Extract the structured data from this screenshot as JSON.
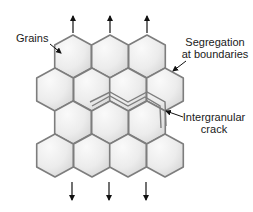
{
  "diagram": {
    "labels": {
      "grains": "Grains",
      "segregation_line1": "Segregation",
      "segregation_line2": "at boundaries",
      "crack_line1": "Intergranular",
      "crack_line2": "crack"
    },
    "colors": {
      "grain_fill_light": "#f7f7f7",
      "grain_fill_dark": "#d9d9d9",
      "boundary": "#7d7d7d",
      "arrow": "#111111",
      "text": "#1a1a1a"
    },
    "grain_rows": [
      {
        "row": 1,
        "top_y": 35,
        "centers_x": [
          73,
          110,
          147
        ]
      },
      {
        "row": 2,
        "top_y": 68,
        "centers_x": [
          55,
          92,
          128,
          165
        ]
      },
      {
        "row": 3,
        "top_y": 101,
        "centers_x": [
          73,
          110,
          147
        ]
      },
      {
        "row": 4,
        "top_y": 134,
        "centers_x": [
          55,
          92,
          128,
          165
        ]
      }
    ],
    "tensile_load_arrows": {
      "top": {
        "direction": "up",
        "x": [
          73,
          110,
          147
        ]
      },
      "bottom": {
        "direction": "down",
        "x": [
          72,
          109,
          146
        ]
      }
    }
  }
}
